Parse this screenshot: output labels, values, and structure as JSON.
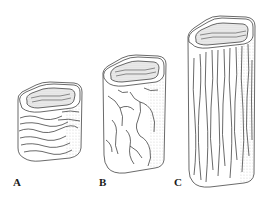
{
  "figure": {
    "background": "#ffffff",
    "ink": "#2a2a2a",
    "specimens": [
      {
        "label": "A",
        "texture": "horizontal wavy lines",
        "relative_height": "short"
      },
      {
        "label": "B",
        "texture": "branching crack network",
        "relative_height": "medium"
      },
      {
        "label": "C",
        "texture": "vertical grain lines",
        "relative_height": "tall"
      }
    ]
  }
}
